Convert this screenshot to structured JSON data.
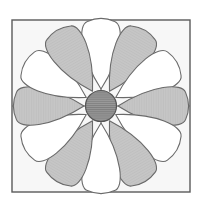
{
  "figure": {
    "name": "twelve-petal-rosette-block",
    "background_color": "#ffffff",
    "canvas": {
      "width": 203,
      "height": 199
    }
  },
  "frame": {
    "name": "outer-square-frame",
    "x": 12,
    "y": 20,
    "width": 178,
    "height": 172,
    "fill_color": "#f7f7f7",
    "stroke_color": "#5a5a5a",
    "stroke_width": 1.4
  },
  "axes": {
    "name": "quadrant-cross-axes",
    "stroke_color": "#6b6b6b",
    "stroke_width": 1.1,
    "vertical_x": 101,
    "horizontal_y": 106,
    "labels": [
      "vertical-axis",
      "horizontal-axis"
    ]
  },
  "center": {
    "name": "center-disc",
    "cx": 101,
    "cy": 106,
    "r": 15.5,
    "fill_color": "#9a9a9a",
    "stroke_color": "#555555",
    "stroke_width": 1.2,
    "hatch": "horizontal-lines",
    "hatch_color": "#7e7e7e"
  },
  "petals": {
    "count": 12,
    "angle_step_deg": 30,
    "tip_radius": 85,
    "bulb_radius": 22,
    "waist_radius": 17,
    "fill_light": "#ffffff",
    "fill_dark": "#c2c2c2",
    "stroke_color": "#6a6a6a",
    "stroke_width": 1.1,
    "items": [
      {
        "name": "petal-01",
        "angle_deg": 0,
        "clock": "12:00",
        "color": "light"
      },
      {
        "name": "petal-02",
        "angle_deg": 30,
        "clock": "01:00",
        "color": "dark"
      },
      {
        "name": "petal-03",
        "angle_deg": 60,
        "clock": "02:00",
        "color": "light"
      },
      {
        "name": "petal-04",
        "angle_deg": 90,
        "clock": "03:00",
        "color": "dark"
      },
      {
        "name": "petal-05",
        "angle_deg": 120,
        "clock": "04:00",
        "color": "light"
      },
      {
        "name": "petal-06",
        "angle_deg": 150,
        "clock": "05:00",
        "color": "dark"
      },
      {
        "name": "petal-07",
        "angle_deg": 180,
        "clock": "06:00",
        "color": "light"
      },
      {
        "name": "petal-08",
        "angle_deg": 210,
        "clock": "07:00",
        "color": "dark"
      },
      {
        "name": "petal-09",
        "angle_deg": 240,
        "clock": "08:00",
        "color": "light"
      },
      {
        "name": "petal-10",
        "angle_deg": 270,
        "clock": "09:00",
        "color": "dark"
      },
      {
        "name": "petal-11",
        "angle_deg": 300,
        "clock": "10:00",
        "color": "light"
      },
      {
        "name": "petal-12",
        "angle_deg": 330,
        "clock": "11:00",
        "color": "dark"
      }
    ]
  }
}
